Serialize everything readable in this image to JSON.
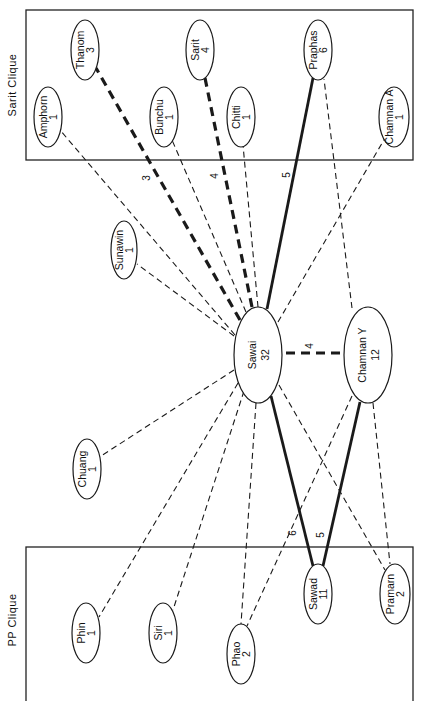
{
  "colors": {
    "line": "#1a1a1a",
    "background": "#ffffff",
    "box": "#222222"
  },
  "cliques": [
    {
      "id": "sarit",
      "label": "Sarit Clique",
      "box": {
        "x": 26,
        "y": 10,
        "w": 387,
        "h": 150
      },
      "label_pos": {
        "x": 16,
        "y": 85
      }
    },
    {
      "id": "pp",
      "label": "PP Clique",
      "box": {
        "x": 26,
        "y": 547,
        "w": 387,
        "h": 155
      },
      "label_pos": {
        "x": 16,
        "y": 620
      }
    }
  ],
  "nodes": [
    {
      "id": "amphorn",
      "name": "Amphorn",
      "value": "1",
      "cx": 48,
      "cy": 117,
      "rx": 14,
      "ry": 30
    },
    {
      "id": "thanom",
      "name": "Thanom",
      "value": "3",
      "cx": 85,
      "cy": 50,
      "rx": 14,
      "ry": 30
    },
    {
      "id": "bunchu",
      "name": "Bunchu",
      "value": "1",
      "cx": 164,
      "cy": 117,
      "rx": 14,
      "ry": 30
    },
    {
      "id": "sarit",
      "name": "Sarit",
      "value": "4",
      "cx": 200,
      "cy": 50,
      "rx": 14,
      "ry": 30
    },
    {
      "id": "chitti",
      "name": "Chitti",
      "value": "1",
      "cx": 241,
      "cy": 117,
      "rx": 14,
      "ry": 30
    },
    {
      "id": "praphas",
      "name": "Praphas",
      "value": "6",
      "cx": 318,
      "cy": 50,
      "rx": 14,
      "ry": 30
    },
    {
      "id": "chamnan_a",
      "name": "Chamnan A",
      "value": "1",
      "cx": 394,
      "cy": 117,
      "rx": 15,
      "ry": 30
    },
    {
      "id": "sunawin",
      "name": "Sunawin",
      "value": "1",
      "cx": 124,
      "cy": 250,
      "rx": 13,
      "ry": 29
    },
    {
      "id": "sawai",
      "name": "Sawai",
      "value": "32",
      "cx": 258,
      "cy": 355,
      "rx": 24,
      "ry": 48
    },
    {
      "id": "chamnan_y",
      "name": "Chamnan Y",
      "value": "12",
      "cx": 368,
      "cy": 355,
      "rx": 24,
      "ry": 48
    },
    {
      "id": "chuang",
      "name": "Chuang",
      "value": "1",
      "cx": 87,
      "cy": 469,
      "rx": 14,
      "ry": 30
    },
    {
      "id": "phin",
      "name": "Phin",
      "value": "1",
      "cx": 86,
      "cy": 633,
      "rx": 14,
      "ry": 30
    },
    {
      "id": "siri",
      "name": "Siri",
      "value": "1",
      "cx": 163,
      "cy": 633,
      "rx": 14,
      "ry": 30
    },
    {
      "id": "phao",
      "name": "Phao",
      "value": "2",
      "cx": 241,
      "cy": 654,
      "rx": 14,
      "ry": 30
    },
    {
      "id": "sawad",
      "name": "Sawad",
      "value": "11",
      "cx": 318,
      "cy": 594,
      "rx": 14,
      "ry": 30
    },
    {
      "id": "pramarn",
      "name": "Pramarn",
      "value": "2",
      "cx": 395,
      "cy": 594,
      "rx": 15,
      "ry": 30
    }
  ],
  "edges": [
    {
      "from": "sawai",
      "to": "amphorn",
      "style": "dashed",
      "x1": 235,
      "y1": 335,
      "x2": 60,
      "y2": 130
    },
    {
      "from": "sawai",
      "to": "thanom",
      "style": "thick-dashed",
      "label": "3",
      "x1": 240,
      "y1": 320,
      "x2": 96,
      "y2": 68,
      "lx": 150,
      "ly": 178
    },
    {
      "from": "sawai",
      "to": "bunchu",
      "style": "dashed",
      "x1": 246,
      "y1": 312,
      "x2": 172,
      "y2": 140
    },
    {
      "from": "sawai",
      "to": "sarit",
      "style": "thick-dashed",
      "label": "4",
      "x1": 252,
      "y1": 307,
      "x2": 205,
      "y2": 78,
      "lx": 218,
      "ly": 176
    },
    {
      "from": "sawai",
      "to": "chitti",
      "style": "dashed",
      "x1": 258,
      "y1": 307,
      "x2": 243,
      "y2": 145
    },
    {
      "from": "sawai",
      "to": "praphas",
      "style": "solid",
      "label": "5",
      "x1": 267,
      "y1": 309,
      "x2": 313,
      "y2": 78,
      "lx": 290,
      "ly": 175
    },
    {
      "from": "sawai",
      "to": "chamnan_a",
      "style": "dashed",
      "x1": 278,
      "y1": 322,
      "x2": 385,
      "y2": 138
    },
    {
      "from": "sawai",
      "to": "sunawin",
      "style": "dashed",
      "x1": 234,
      "y1": 336,
      "x2": 137,
      "y2": 264
    },
    {
      "from": "sawai",
      "to": "chuang",
      "style": "dashed",
      "x1": 234,
      "y1": 370,
      "x2": 101,
      "y2": 456
    },
    {
      "from": "sawai",
      "to": "phin",
      "style": "dashed",
      "x1": 238,
      "y1": 383,
      "x2": 99,
      "y2": 617
    },
    {
      "from": "sawai",
      "to": "siri",
      "style": "dashed",
      "x1": 244,
      "y1": 391,
      "x2": 173,
      "y2": 610
    },
    {
      "from": "sawai",
      "to": "phao",
      "style": "dashed",
      "x1": 256,
      "y1": 403,
      "x2": 241,
      "y2": 624
    },
    {
      "from": "sawai",
      "to": "sawad",
      "style": "solid",
      "label": "6",
      "x1": 271,
      "y1": 396,
      "x2": 313,
      "y2": 566,
      "lx": 296,
      "ly": 533
    },
    {
      "from": "sawai",
      "to": "pramarn",
      "style": "dashed",
      "x1": 279,
      "y1": 385,
      "x2": 385,
      "y2": 570
    },
    {
      "from": "sawai",
      "to": "chamnan_y",
      "style": "thick-dashed",
      "label": "4",
      "x1": 286,
      "y1": 353,
      "x2": 342,
      "y2": 353,
      "lx": 313,
      "ly": 346
    },
    {
      "from": "chamnan_y",
      "to": "praphas",
      "style": "dashed",
      "x1": 352,
      "y1": 308,
      "x2": 324,
      "y2": 79
    },
    {
      "from": "chamnan_y",
      "to": "sawad",
      "style": "solid",
      "label": "5",
      "x1": 360,
      "y1": 402,
      "x2": 323,
      "y2": 566,
      "lx": 324,
      "ly": 535
    },
    {
      "from": "chamnan_y",
      "to": "pramarn",
      "style": "dashed",
      "x1": 373,
      "y1": 403,
      "x2": 390,
      "y2": 564
    },
    {
      "from": "chamnan_y",
      "to": "phao",
      "style": "dashed",
      "x1": 352,
      "y1": 396,
      "x2": 247,
      "y2": 626
    }
  ]
}
